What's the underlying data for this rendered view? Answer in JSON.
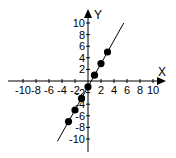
{
  "chart_data": {
    "type": "line",
    "title": "",
    "xlabel": "X",
    "ylabel": "Y",
    "xlim": [
      -11,
      11
    ],
    "ylim": [
      -11,
      11
    ],
    "grid": false,
    "x_ticks": [
      -10,
      -8,
      -6,
      -4,
      -2,
      2,
      4,
      6,
      8,
      10
    ],
    "y_ticks": [
      -10,
      -8,
      -6,
      -4,
      -2,
      2,
      4,
      6,
      8,
      10
    ],
    "x_tick_labels": [
      "-10",
      "-8",
      "-6",
      "-4",
      "-2",
      "2",
      "4",
      "6",
      "8",
      "10"
    ],
    "y_tick_labels": [
      "-10",
      "-8",
      "-6",
      "-4",
      "-2",
      "2",
      "4",
      "6",
      "8",
      "10"
    ],
    "series": [
      {
        "name": "y = 2x - 1",
        "line_x_range": [
          -4.7,
          5.5
        ],
        "points": [
          {
            "x": -3,
            "y": -7
          },
          {
            "x": -2,
            "y": -5
          },
          {
            "x": -1,
            "y": -3
          },
          {
            "x": 0,
            "y": -1
          },
          {
            "x": 1,
            "y": 1
          },
          {
            "x": 2,
            "y": 3
          },
          {
            "x": 3,
            "y": 5
          }
        ]
      }
    ],
    "colors": {
      "line": "#000000",
      "points": "#000000",
      "axes": "#000000"
    }
  }
}
